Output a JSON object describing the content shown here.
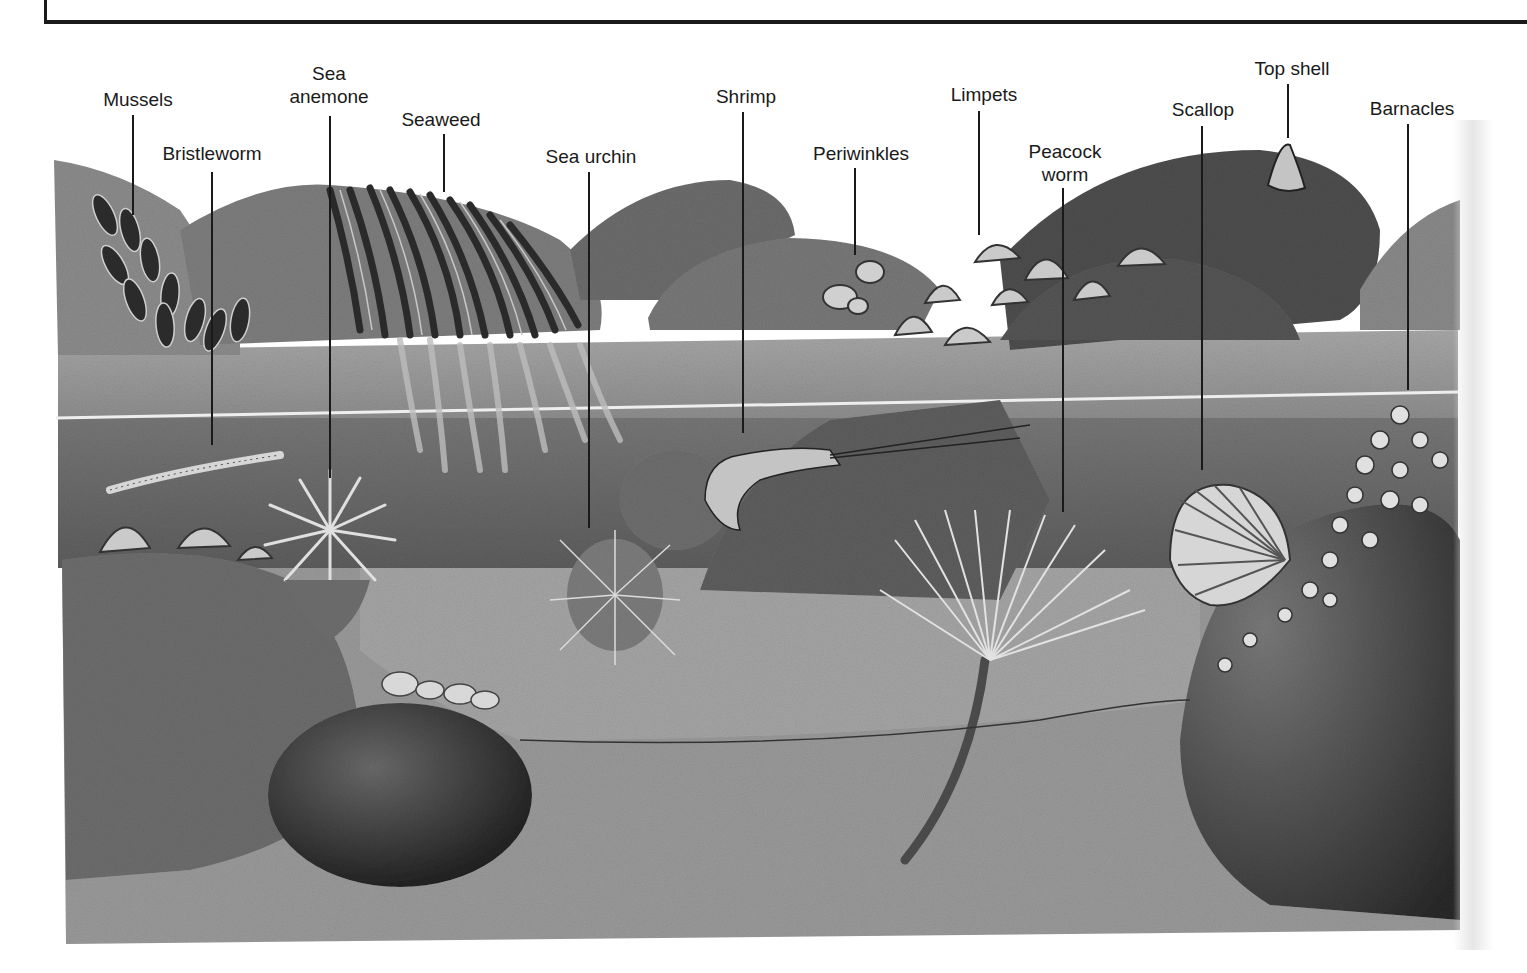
{
  "figure": {
    "labels": [
      {
        "id": "mussels",
        "text": "Mussels",
        "x": 138,
        "y": 88,
        "line_top": 115,
        "line_bottom": 215
      },
      {
        "id": "bristleworm",
        "text": "Bristleworm",
        "x": 212,
        "y": 142,
        "line_top": 172,
        "line_bottom": 445
      },
      {
        "id": "sea-anemone",
        "text": "Sea\nanemone",
        "x": 329,
        "y": 62,
        "line_top": 116,
        "line_bottom": 478
      },
      {
        "id": "seaweed",
        "text": "Seaweed",
        "x": 441,
        "y": 108,
        "line_top": 134,
        "line_bottom": 192
      },
      {
        "id": "sea-urchin",
        "text": "Sea urchin",
        "x": 591,
        "y": 145,
        "line_top": 172,
        "line_bottom": 528
      },
      {
        "id": "shrimp",
        "text": "Shrimp",
        "x": 746,
        "y": 85,
        "line_top": 112,
        "line_bottom": 433
      },
      {
        "id": "periwinkles",
        "text": "Periwinkles",
        "x": 861,
        "y": 142,
        "line_top": 168,
        "line_bottom": 255
      },
      {
        "id": "limpets",
        "text": "Limpets",
        "x": 984,
        "y": 83,
        "line_top": 111,
        "line_bottom": 235
      },
      {
        "id": "peacock-worm",
        "text": "Peacock\nworm",
        "x": 1065,
        "y": 140,
        "line_top": 188,
        "line_bottom": 512
      },
      {
        "id": "scallop",
        "text": "Scallop",
        "x": 1203,
        "y": 98,
        "line_top": 126,
        "line_bottom": 470
      },
      {
        "id": "top-shell",
        "text": "Top shell",
        "x": 1292,
        "y": 57,
        "line_top": 84,
        "line_bottom": 138
      },
      {
        "id": "barnacles",
        "text": "Barnacles",
        "x": 1412,
        "y": 97,
        "line_top": 124,
        "line_bottom": 390
      }
    ]
  },
  "colors": {
    "ink": "#1a1a1a",
    "sky": "#ffffff",
    "rock_light": "#8a8a8a",
    "rock_mid": "#6e6e6e",
    "rock_dark": "#3e3e3e",
    "water_surface": "#9a9a9a",
    "water_deep": "#5a5a5a",
    "sand": "#9c9c9c",
    "seaweed": "#2e2e2e"
  }
}
